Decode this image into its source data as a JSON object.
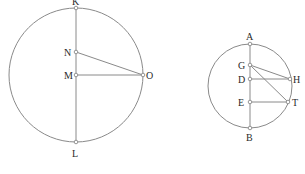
{
  "diagram": {
    "stroke_color": "#8a8a8a",
    "label_color": "#2a2a2a",
    "left_figure": {
      "circle": {
        "cx": 76,
        "cy": 75,
        "r": 67
      },
      "points": {
        "K": {
          "label": "K",
          "x": 76,
          "y": 8
        },
        "N": {
          "label": "N",
          "x": 76,
          "y": 52
        },
        "M": {
          "label": "M",
          "x": 76,
          "y": 75
        },
        "O": {
          "label": "O",
          "x": 143,
          "y": 75
        },
        "L": {
          "label": "L",
          "x": 76,
          "y": 142
        }
      },
      "segments": [
        "KL",
        "NO",
        "MO"
      ]
    },
    "right_figure": {
      "circle": {
        "cx": 250,
        "cy": 86,
        "r": 42
      },
      "points": {
        "A": {
          "label": "A",
          "x": 250,
          "y": 44
        },
        "G": {
          "label": "G",
          "x": 250,
          "y": 65
        },
        "D": {
          "label": "D",
          "x": 250,
          "y": 79
        },
        "E": {
          "label": "E",
          "x": 250,
          "y": 102
        },
        "B": {
          "label": "B",
          "x": 250,
          "y": 128
        },
        "H": {
          "label": "H",
          "x": 290,
          "y": 79
        },
        "T": {
          "label": "T",
          "x": 288,
          "y": 102
        }
      },
      "segments": [
        "AB",
        "GH",
        "GT",
        "DH",
        "ET"
      ]
    }
  }
}
